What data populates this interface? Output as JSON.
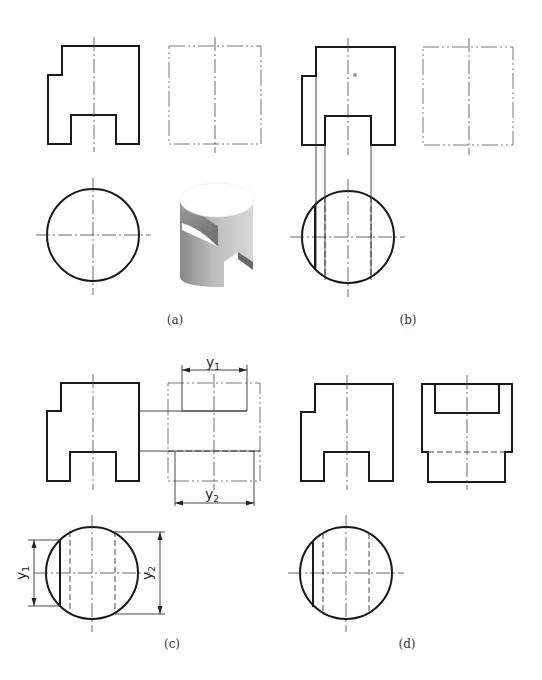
{
  "figure": {
    "panels": [
      {
        "id": "a",
        "caption": "(a)",
        "views": [
          "front-view",
          "side-view-blank",
          "top-view-circle",
          "isometric-cylinder-with-slot-and-step"
        ]
      },
      {
        "id": "b",
        "caption": "(b)",
        "views": [
          "front-view",
          "side-view-blank",
          "top-view-with-projection-lines"
        ]
      },
      {
        "id": "c",
        "caption": "(c)",
        "views": [
          "front-view",
          "side-view-construction",
          "top-view-dimensioned"
        ]
      },
      {
        "id": "d",
        "caption": "(d)",
        "views": [
          "front-view",
          "side-view-completed",
          "top-view"
        ]
      }
    ],
    "dimensions": {
      "y1_base": "y",
      "y1_sub": "1",
      "y2_base": "y",
      "y2_sub": "2"
    },
    "colors": {
      "line": "#1a1a1a",
      "background": "#ffffff",
      "shade_light": "#d0d0d0",
      "shade_dark": "#7a7a7a"
    }
  }
}
